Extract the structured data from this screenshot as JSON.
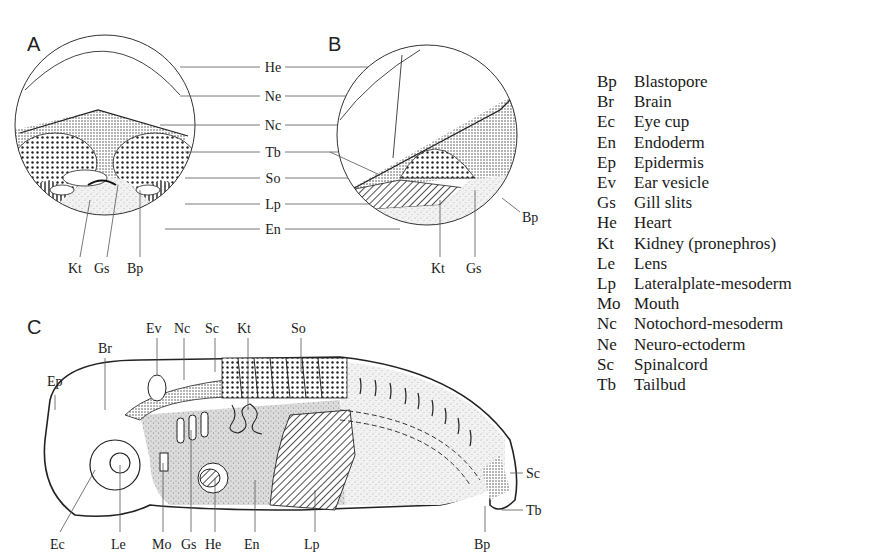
{
  "panels": {
    "a": {
      "letter": "A",
      "center_labels": [
        "He",
        "Ne",
        "Nc",
        "Tb",
        "So",
        "Lp",
        "En"
      ],
      "bottom_labels": [
        "Kt",
        "Gs",
        "Bp"
      ]
    },
    "b": {
      "letter": "B",
      "side_label": "Bp",
      "bottom_labels": [
        "Kt",
        "Gs"
      ]
    },
    "c": {
      "letter": "C",
      "top_labels": [
        "Br",
        "Ev",
        "Nc",
        "Sc",
        "Kt",
        "So"
      ],
      "left_label": "Ep",
      "bottom_labels": [
        "Ec",
        "Le",
        "Mo",
        "Gs",
        "He",
        "En",
        "Lp",
        "Bp"
      ],
      "tail_labels": [
        "Sc",
        "Tb"
      ]
    }
  },
  "legend": [
    {
      "abbr": "Bp",
      "term": "Blastopore"
    },
    {
      "abbr": "Br",
      "term": "Brain"
    },
    {
      "abbr": "Ec",
      "term": "Eye cup"
    },
    {
      "abbr": "En",
      "term": "Endoderm"
    },
    {
      "abbr": "Ep",
      "term": "Epidermis"
    },
    {
      "abbr": "Ev",
      "term": "Ear vesicle"
    },
    {
      "abbr": "Gs",
      "term": "Gill slits"
    },
    {
      "abbr": "He",
      "term": "Heart"
    },
    {
      "abbr": "Kt",
      "term": "Kidney (pronephros)"
    },
    {
      "abbr": "Le",
      "term": "Lens"
    },
    {
      "abbr": "Lp",
      "term": "Lateralplate-mesoderm"
    },
    {
      "abbr": "Mo",
      "term": "Mouth"
    },
    {
      "abbr": "Nc",
      "term": "Notochord-mesoderm"
    },
    {
      "abbr": "Ne",
      "term": "Neuro-ectoderm"
    },
    {
      "abbr": "Sc",
      "term": "Spinalcord"
    },
    {
      "abbr": "Tb",
      "term": "Tailbud"
    }
  ]
}
